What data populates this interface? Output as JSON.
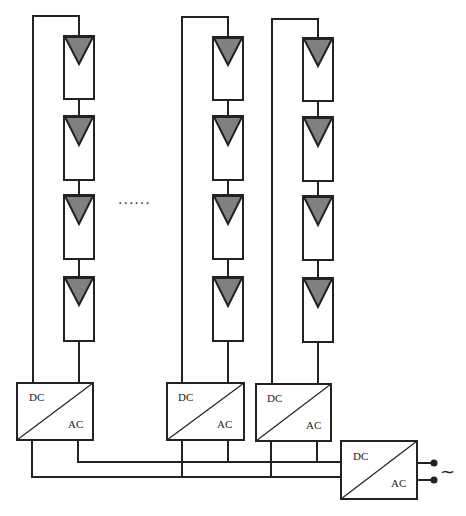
{
  "diagram": {
    "type": "PV micro-inverter string architecture",
    "colors": {
      "line": "#222222",
      "panel_triangle": "#808080",
      "background": "#ffffff"
    },
    "strings": [
      {
        "id": "string-1",
        "panels": 4
      },
      {
        "id": "string-2",
        "panels": 4
      },
      {
        "id": "string-3",
        "panels": 4
      }
    ],
    "ellipsis": "......",
    "string_inverters": [
      {
        "dc_label": "DC",
        "ac_label": "AC"
      },
      {
        "dc_label": "DC",
        "ac_label": "AC"
      },
      {
        "dc_label": "DC",
        "ac_label": "AC"
      }
    ],
    "central_inverter": {
      "dc_label": "DC",
      "ac_label": "AC"
    },
    "ac_output_symbol": "~"
  }
}
